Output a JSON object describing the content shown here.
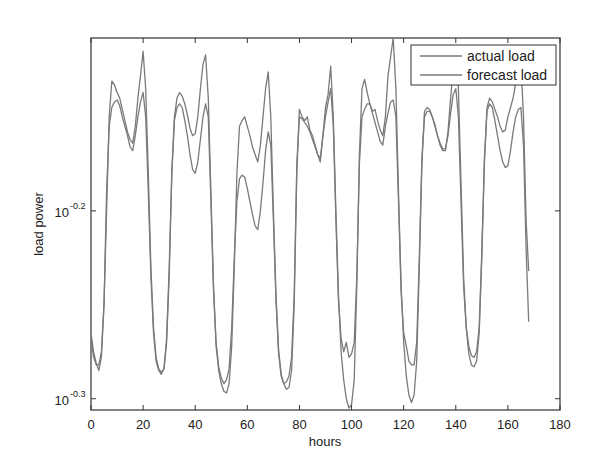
{
  "chart_data": {
    "type": "line",
    "title": "",
    "xlabel": "hours",
    "ylabel": "load power",
    "xlim": [
      0,
      180
    ],
    "ylim_log10": [
      -0.306,
      -0.108
    ],
    "y_scale": "log",
    "grid": false,
    "x_ticks": [
      "0",
      "20",
      "40",
      "60",
      "80",
      "100",
      "120",
      "140",
      "160",
      "180"
    ],
    "y_ticks": [
      {
        "base": "10",
        "exponent": "-0.3",
        "log10": -0.3
      },
      {
        "base": "10",
        "exponent": "-0.2",
        "log10": -0.2
      }
    ],
    "legend": {
      "position": "top-right",
      "entries": [
        "actual load",
        "forecast load"
      ]
    },
    "line_color": "#7a7a7a",
    "x": "hours 0..168 (one value per hour)",
    "series": [
      {
        "name": "actual load",
        "values_log10": [
          -0.268,
          -0.278,
          -0.282,
          -0.282,
          -0.275,
          -0.25,
          -0.2,
          -0.15,
          -0.131,
          -0.133,
          -0.137,
          -0.14,
          -0.146,
          -0.152,
          -0.158,
          -0.162,
          -0.164,
          -0.155,
          -0.14,
          -0.128,
          -0.115,
          -0.135,
          -0.18,
          -0.23,
          -0.262,
          -0.278,
          -0.284,
          -0.286,
          -0.284,
          -0.27,
          -0.235,
          -0.18,
          -0.15,
          -0.14,
          -0.137,
          -0.139,
          -0.143,
          -0.149,
          -0.156,
          -0.16,
          -0.159,
          -0.15,
          -0.135,
          -0.122,
          -0.117,
          -0.14,
          -0.19,
          -0.24,
          -0.272,
          -0.285,
          -0.292,
          -0.296,
          -0.297,
          -0.292,
          -0.272,
          -0.23,
          -0.18,
          -0.155,
          -0.152,
          -0.15,
          -0.155,
          -0.16,
          -0.166,
          -0.17,
          -0.174,
          -0.165,
          -0.15,
          -0.135,
          -0.126,
          -0.15,
          -0.2,
          -0.245,
          -0.274,
          -0.287,
          -0.292,
          -0.295,
          -0.294,
          -0.285,
          -0.25,
          -0.18,
          -0.146,
          -0.15,
          -0.152,
          -0.15,
          -0.157,
          -0.16,
          -0.165,
          -0.17,
          -0.174,
          -0.16,
          -0.145,
          -0.138,
          -0.123,
          -0.15,
          -0.2,
          -0.245,
          -0.275,
          -0.29,
          -0.3,
          -0.305,
          -0.303,
          -0.29,
          -0.24,
          -0.17,
          -0.135,
          -0.13,
          -0.137,
          -0.143,
          -0.147,
          -0.146,
          -0.152,
          -0.157,
          -0.16,
          -0.15,
          -0.128,
          -0.118,
          -0.108,
          -0.135,
          -0.19,
          -0.24,
          -0.27,
          -0.288,
          -0.298,
          -0.302,
          -0.298,
          -0.28,
          -0.23,
          -0.175,
          -0.147,
          -0.145,
          -0.146,
          -0.15,
          -0.154,
          -0.16,
          -0.165,
          -0.168,
          -0.168,
          -0.158,
          -0.14,
          -0.125,
          -0.118,
          -0.135,
          -0.185,
          -0.235,
          -0.262,
          -0.276,
          -0.282,
          -0.283,
          -0.28,
          -0.265,
          -0.225,
          -0.175,
          -0.145,
          -0.14,
          -0.142,
          -0.146,
          -0.15,
          -0.155,
          -0.158,
          -0.157,
          -0.15,
          -0.145,
          -0.14,
          -0.132,
          -0.124,
          -0.121,
          -0.15,
          -0.205,
          -0.232
        ]
      },
      {
        "name": "forecast load",
        "values_log10": [
          -0.265,
          -0.275,
          -0.281,
          -0.285,
          -0.278,
          -0.25,
          -0.19,
          -0.155,
          -0.145,
          -0.142,
          -0.141,
          -0.144,
          -0.15,
          -0.155,
          -0.16,
          -0.166,
          -0.168,
          -0.16,
          -0.15,
          -0.142,
          -0.137,
          -0.15,
          -0.19,
          -0.235,
          -0.265,
          -0.28,
          -0.285,
          -0.287,
          -0.284,
          -0.268,
          -0.23,
          -0.18,
          -0.152,
          -0.145,
          -0.143,
          -0.145,
          -0.152,
          -0.16,
          -0.17,
          -0.178,
          -0.18,
          -0.174,
          -0.162,
          -0.15,
          -0.143,
          -0.15,
          -0.195,
          -0.242,
          -0.27,
          -0.283,
          -0.289,
          -0.292,
          -0.29,
          -0.284,
          -0.262,
          -0.225,
          -0.195,
          -0.183,
          -0.181,
          -0.182,
          -0.188,
          -0.195,
          -0.202,
          -0.208,
          -0.21,
          -0.2,
          -0.185,
          -0.168,
          -0.158,
          -0.165,
          -0.205,
          -0.248,
          -0.276,
          -0.288,
          -0.292,
          -0.291,
          -0.288,
          -0.278,
          -0.245,
          -0.175,
          -0.15,
          -0.151,
          -0.153,
          -0.155,
          -0.158,
          -0.162,
          -0.166,
          -0.17,
          -0.172,
          -0.16,
          -0.15,
          -0.142,
          -0.135,
          -0.155,
          -0.205,
          -0.248,
          -0.268,
          -0.275,
          -0.27,
          -0.278,
          -0.276,
          -0.27,
          -0.235,
          -0.175,
          -0.15,
          -0.146,
          -0.143,
          -0.143,
          -0.148,
          -0.153,
          -0.158,
          -0.163,
          -0.165,
          -0.155,
          -0.148,
          -0.142,
          -0.141,
          -0.15,
          -0.195,
          -0.243,
          -0.265,
          -0.272,
          -0.28,
          -0.282,
          -0.282,
          -0.27,
          -0.225,
          -0.172,
          -0.15,
          -0.147,
          -0.147,
          -0.15,
          -0.155,
          -0.16,
          -0.164,
          -0.167,
          -0.167,
          -0.16,
          -0.148,
          -0.138,
          -0.135,
          -0.15,
          -0.195,
          -0.24,
          -0.262,
          -0.272,
          -0.277,
          -0.278,
          -0.275,
          -0.262,
          -0.222,
          -0.172,
          -0.147,
          -0.143,
          -0.145,
          -0.152,
          -0.16,
          -0.168,
          -0.174,
          -0.177,
          -0.176,
          -0.168,
          -0.158,
          -0.15,
          -0.146,
          -0.145,
          -0.165,
          -0.22,
          -0.259
        ]
      }
    ]
  }
}
